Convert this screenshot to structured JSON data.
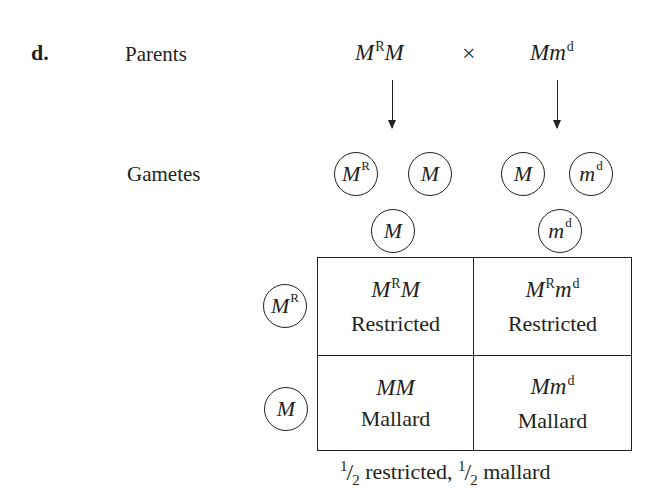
{
  "panel_label": "d.",
  "rows": {
    "parents_label": "Parents",
    "gametes_label": "Gametes"
  },
  "parents": {
    "left": {
      "base": "M",
      "sup": "R",
      "rest": "M",
      "full": "MᴿM"
    },
    "cross_symbol": "×",
    "right": {
      "base": "Mm",
      "sup": "d",
      "full": "Mmᵈ"
    }
  },
  "gametes": [
    {
      "base": "M",
      "sup": "R"
    },
    {
      "base": "M",
      "sup": ""
    },
    {
      "base": "M",
      "sup": ""
    },
    {
      "base": "m",
      "sup": "d"
    }
  ],
  "punnett": {
    "column_headers": [
      {
        "base": "M",
        "sup": ""
      },
      {
        "base": "m",
        "sup": "d"
      }
    ],
    "row_headers": [
      {
        "base": "M",
        "sup": "R"
      },
      {
        "base": "M",
        "sup": ""
      }
    ],
    "cells": [
      [
        {
          "g1": "M",
          "s1": "R",
          "g2": "M",
          "s2": "",
          "phenotype": "Restricted"
        },
        {
          "g1": "M",
          "s1": "R",
          "g2": "m",
          "s2": "d",
          "phenotype": "Restricted"
        }
      ],
      [
        {
          "g1": "MM",
          "s1": "",
          "g2": "",
          "s2": "",
          "phenotype": "Mallard"
        },
        {
          "g1": "Mm",
          "s1": "d",
          "g2": "",
          "s2": "",
          "phenotype": "Mallard"
        }
      ]
    ]
  },
  "result": {
    "frac1_num": "1",
    "frac1_den": "2",
    "text1": " restricted, ",
    "frac2_num": "1",
    "frac2_den": "2",
    "text2": " mallard",
    "full": "1/2 restricted, 1/2 mallard"
  },
  "colors": {
    "ink": "#231f20",
    "background": "#ffffff"
  }
}
